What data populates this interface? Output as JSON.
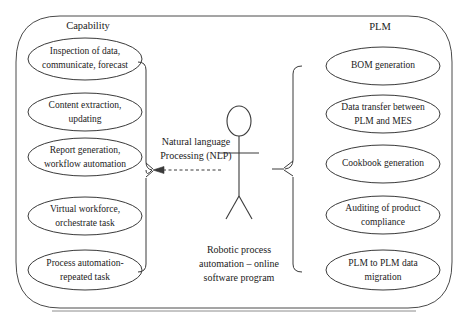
{
  "diagram": {
    "outer_container": {
      "label_left": "Capability",
      "label_right": "PLM"
    },
    "actor": {
      "name": "Robotic process automation actor",
      "caption_lines": [
        "Robotic process",
        "automation – online",
        "software program"
      ]
    },
    "relationship": {
      "label_lines": [
        "Natural language",
        "Processing (NLP)"
      ],
      "arrow_style": "dashed-arrow-left"
    },
    "capability_use_cases": [
      {
        "name": "inspection-of-data",
        "lines": [
          "Inspection of data,",
          "communicate, forecast"
        ]
      },
      {
        "name": "content-extraction",
        "lines": [
          "Content extraction,",
          "updating"
        ]
      },
      {
        "name": "report-generation",
        "lines": [
          "Report generation,",
          "workflow automation"
        ]
      },
      {
        "name": "virtual-workforce",
        "lines": [
          "Virtual workforce,",
          "orchestrate task"
        ]
      },
      {
        "name": "process-automation",
        "lines": [
          "Process automation-",
          "repeated task"
        ]
      }
    ],
    "plm_use_cases": [
      {
        "name": "bom-generation",
        "lines": [
          "BOM generation"
        ]
      },
      {
        "name": "data-transfer",
        "lines": [
          "Data transfer between",
          "PLM and MES"
        ]
      },
      {
        "name": "cookbook-generation",
        "lines": [
          "Cookbook generation"
        ]
      },
      {
        "name": "auditing-compliance",
        "lines": [
          "Auditing of product",
          "compliance"
        ]
      },
      {
        "name": "plm-to-plm-migration",
        "lines": [
          "PLM to PLM data",
          "migration"
        ]
      }
    ],
    "colors": {
      "stroke": "#3a3a3a",
      "container_stroke": "#4a4a4a",
      "text": "#222222",
      "background": "#ffffff"
    }
  }
}
